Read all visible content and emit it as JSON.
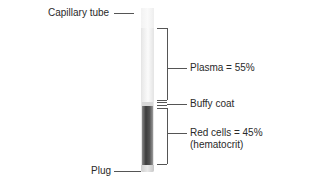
{
  "diagram": {
    "labels": {
      "capillary_tube": "Capillary tube",
      "plasma": "Plasma = 55%",
      "buffy_coat": "Buffy coat",
      "red_cells_line1": "Red cells = 45%",
      "red_cells_line2": "(hematocrit)",
      "plug": "Plug"
    },
    "layers": [
      {
        "name": "Plasma",
        "percent": 55,
        "color": "#f7f7f7"
      },
      {
        "name": "Buffy coat",
        "percent": null,
        "color": "#d8d8d8"
      },
      {
        "name": "Red cells",
        "percent": 45,
        "color": "#4a4a4a"
      }
    ],
    "colors": {
      "leader_line": "#555555",
      "text": "#2a2a2a"
    }
  }
}
